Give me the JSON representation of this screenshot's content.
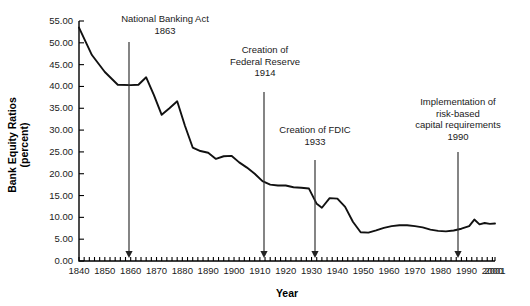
{
  "chart_data": {
    "type": "line",
    "title": "",
    "xlabel": "Year",
    "ylabel": "Bank Equity Ratios (percent)",
    "ylabel_line1": "Bank Equity Ratios",
    "ylabel_line2": "(percent)",
    "xlim": [
      1840,
      2001
    ],
    "ylim": [
      0,
      55
    ],
    "grid": false,
    "legend": "none",
    "ytick_labels": [
      "0.00",
      "5.00",
      "10.00",
      "15.00",
      "20.00",
      "25.00",
      "30.00",
      "35.00",
      "40.00",
      "45.00",
      "50.00",
      "55.00"
    ],
    "ytick_values": [
      0,
      5,
      10,
      15,
      20,
      25,
      30,
      35,
      40,
      45,
      50,
      55
    ],
    "xtick_labels": [
      "1840",
      "1850",
      "1860",
      "1870",
      "1880",
      "1890",
      "1900",
      "1910",
      "1920",
      "1930",
      "1940",
      "1950",
      "1960",
      "1970",
      "1980",
      "1990",
      "2000",
      "2001"
    ],
    "xtick_values": [
      1840,
      1850,
      1860,
      1870,
      1880,
      1890,
      1900,
      1910,
      1920,
      1930,
      1940,
      1950,
      1960,
      1970,
      1980,
      1990,
      2000,
      2001
    ],
    "xminor_step": 2,
    "series": [
      {
        "name": "Bank equity ratio",
        "color": "#111111",
        "x": [
          1840,
          1845,
          1850,
          1855,
          1860,
          1863,
          1866,
          1869,
          1872,
          1875,
          1878,
          1881,
          1884,
          1887,
          1890,
          1893,
          1896,
          1899,
          1902,
          1905,
          1908,
          1911,
          1914,
          1917,
          1920,
          1923,
          1926,
          1929,
          1932,
          1934,
          1937,
          1940,
          1943,
          1946,
          1949,
          1952,
          1955,
          1958,
          1961,
          1964,
          1967,
          1970,
          1973,
          1976,
          1979,
          1982,
          1985,
          1988,
          1991,
          1993,
          1995,
          1997,
          1999,
          2001
        ],
        "y": [
          53.5,
          47.2,
          43.3,
          40.4,
          40.3,
          40.4,
          42.1,
          38.0,
          33.5,
          35.0,
          36.6,
          31.0,
          26.0,
          25.2,
          24.8,
          23.4,
          24.0,
          24.1,
          22.6,
          21.4,
          20.0,
          18.3,
          17.5,
          17.3,
          17.3,
          16.9,
          16.8,
          16.6,
          13.1,
          12.2,
          14.4,
          14.3,
          12.4,
          9.0,
          6.6,
          6.5,
          7.0,
          7.6,
          8.0,
          8.2,
          8.2,
          8.0,
          7.7,
          7.2,
          6.9,
          6.8,
          7.0,
          7.4,
          8.0,
          9.5,
          8.4,
          8.7,
          8.5,
          8.6
        ]
      }
    ],
    "annotations": [
      {
        "id": "national-banking-act",
        "lines": [
          "National Banking Act",
          "1863"
        ],
        "year": 1863,
        "label_x": 165,
        "label_y": 22,
        "arrow_x": 129,
        "arrow_y0": 42,
        "arrow_y1": 258
      },
      {
        "id": "federal-reserve",
        "lines": [
          "Creation of",
          "Federal Reserve",
          "1914"
        ],
        "year": 1914,
        "label_x": 265,
        "label_y": 53,
        "arrow_x": 264,
        "arrow_y0": 92,
        "arrow_y1": 258
      },
      {
        "id": "fdic",
        "lines": [
          "Creation of FDIC",
          "1933"
        ],
        "year": 1933,
        "label_x": 315,
        "label_y": 133,
        "arrow_x": 315,
        "arrow_y0": 160,
        "arrow_y1": 258
      },
      {
        "id": "risk-based-capital",
        "lines": [
          "Implementation of",
          "risk-based",
          "capital requirements",
          "1990"
        ],
        "year": 1990,
        "label_x": 458,
        "label_y": 105,
        "arrow_x": 458,
        "arrow_y0": 152,
        "arrow_y1": 258
      }
    ]
  }
}
